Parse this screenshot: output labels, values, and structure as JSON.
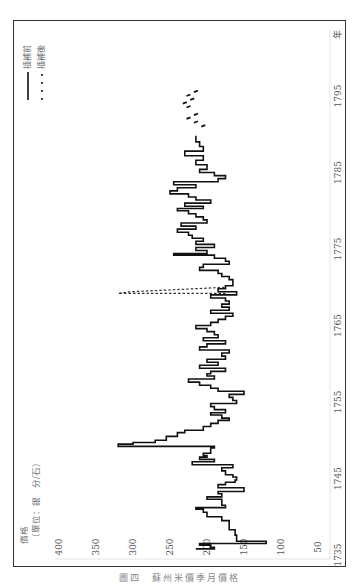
{
  "figure": {
    "caption": "圖四　蘇州米價季月價格",
    "orientation": "rotated 90° counterclockwise"
  },
  "axes": {
    "y_label_line1": "價格",
    "y_label_line2": "（單位：銀　分/石）",
    "y_ticks": [
      "400",
      "350",
      "300",
      "250",
      "200",
      "150",
      "100",
      "50"
    ],
    "x_ticks": [
      "1735",
      "1745",
      "1755",
      "1765",
      "1775",
      "1785",
      "1795"
    ],
    "x_unit": "年"
  },
  "legend": {
    "items": [
      {
        "label": "插補前",
        "style": "solid"
      },
      {
        "label": "插補後",
        "style": "dashed"
      }
    ]
  },
  "chart_data": {
    "type": "line",
    "title": "蘇州米價季月價格",
    "xlabel": "年",
    "ylabel": "價格（單位：銀 分/石）",
    "xlim": [
      1735,
      1797
    ],
    "ylim": [
      50,
      400
    ],
    "grid": false,
    "legend_position": "top-left (rotated: upper right of plot)",
    "series": [
      {
        "name": "插補前",
        "style": "solid",
        "x": [
          1735.8,
          1736.0,
          1736.3,
          1736.5,
          1736.8,
          1737.2,
          1737.6,
          1738.3,
          1739.5,
          1740.0,
          1740.6,
          1741.0,
          1741.2,
          1741.5,
          1741.8,
          1742.3,
          1742.6,
          1743.0,
          1743.3,
          1743.8,
          1744.2,
          1744.5,
          1744.8,
          1745.2,
          1745.5,
          1746.0,
          1746.4,
          1746.8,
          1747.2,
          1747.5,
          1747.8,
          1748.0,
          1748.3,
          1748.7,
          1749.0,
          1749.2,
          1749.5,
          1749.7,
          1750.0,
          1750.5,
          1751.0,
          1751.3,
          1751.8,
          1752.2,
          1752.6,
          1752.9,
          1753.3,
          1753.6,
          1754.0,
          1754.4,
          1754.8,
          1755.2,
          1755.6,
          1756.0,
          1756.4,
          1756.8,
          1757.2,
          1757.6,
          1758.0,
          1758.4,
          1758.7,
          1759.0,
          1759.4,
          1759.8,
          1760.2,
          1760.6,
          1761.0,
          1761.4,
          1761.8,
          1762.2,
          1762.6,
          1763.0,
          1763.4,
          1763.8,
          1764.2,
          1764.6,
          1765.0,
          1765.4,
          1765.8,
          1766.2,
          1766.6,
          1767.0,
          1767.4,
          1767.8,
          1768.2,
          1768.6,
          1769.0,
          1769.4,
          1769.8,
          1770.2,
          1770.6,
          1771.0,
          1771.4,
          1771.8,
          1772.2,
          1772.6,
          1773.0,
          1773.4,
          1773.8,
          1774.2,
          1774.4,
          1774.8,
          1775.2,
          1775.6,
          1776.0,
          1776.4,
          1776.8,
          1777.2,
          1777.6,
          1778.0,
          1778.4,
          1778.8,
          1779.2,
          1779.6,
          1780.0,
          1780.3,
          1780.6,
          1781.0,
          1781.4,
          1781.8,
          1782.2,
          1782.6,
          1783.0,
          1783.4,
          1783.8,
          1784.2,
          1784.6,
          1785.0,
          1785.4,
          1786.0,
          1786.6,
          1787.2,
          1787.8,
          1788.4,
          1789.0,
          1789.4,
          1789.8
        ],
        "y": [
          215,
          190,
          195,
          210,
          120,
          160,
          160,
          162,
          170,
          180,
          200,
          205,
          215,
          175,
          180,
          180,
          200,
          180,
          185,
          150,
          185,
          175,
          162,
          160,
          165,
          175,
          180,
          165,
          220,
          190,
          210,
          200,
          205,
          195,
          195,
          190,
          320,
          300,
          270,
          255,
          240,
          230,
          205,
          195,
          185,
          170,
          180,
          195,
          175,
          190,
          195,
          160,
          165,
          170,
          150,
          185,
          195,
          210,
          225,
          190,
          200,
          195,
          175,
          210,
          185,
          200,
          175,
          180,
          170,
          210,
          200,
          175,
          205,
          185,
          190,
          200,
          215,
          195,
          185,
          175,
          165,
          195,
          170,
          180,
          170,
          175,
          195,
          160,
          185,
          175,
          165,
          165,
          170,
          180,
          185,
          210,
          205,
          170,
          175,
          190,
          245,
          200,
          215,
          190,
          215,
          205,
          220,
          225,
          240,
          215,
          235,
          200,
          205,
          215,
          225,
          240,
          205,
          230,
          195,
          215,
          225,
          250,
          240,
          215,
          245,
          185,
          175,
          190,
          210,
          200,
          215,
          205,
          230,
          205,
          210,
          215,
          215
        ],
        "note": "values estimated from rotated figure; approximate"
      },
      {
        "name": "插補前 (scattered points, late period)",
        "style": "solid-fragments",
        "x": [
          1791.0,
          1791.5,
          1792.0,
          1792.5,
          1793.5,
          1794.0,
          1794.5,
          1795.0,
          1795.5
        ],
        "y": [
          205,
          215,
          225,
          215,
          225,
          230,
          220,
          225,
          215
        ]
      },
      {
        "name": "插補後",
        "style": "dashed",
        "x": [
          1769.2,
          1769.2,
          1769.4,
          1770.0
        ],
        "y": [
          175,
          320,
          305,
          175
        ],
        "note": "vertical dashed excursion to ~320 near 1769"
      }
    ]
  }
}
